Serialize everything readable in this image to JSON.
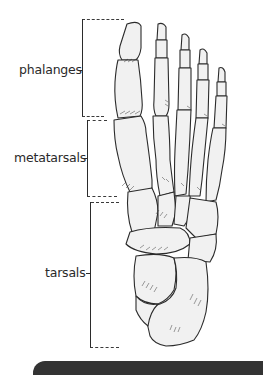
{
  "diagram": {
    "labels": [
      {
        "id": "phalanges",
        "text": "phalanges"
      },
      {
        "id": "metatarsals",
        "text": "metatarsals"
      },
      {
        "id": "tarsals",
        "text": "tarsals"
      }
    ]
  },
  "colors": {
    "bone_fill": "#f1f1f1",
    "line": "#2b2b2b",
    "bottom_bar": "#333333"
  }
}
